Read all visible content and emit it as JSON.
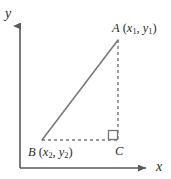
{
  "figure": {
    "background_color": "#ffffff",
    "line_color": "#6e6e6e",
    "axis_color": "#5a5a5a",
    "text_color": "#2b2b2b",
    "width": 171,
    "height": 179
  },
  "axes": {
    "x_label": "x",
    "y_label": "y",
    "x_axis": {
      "x1": 20,
      "y1": 168,
      "x2": 150,
      "y2": 168,
      "arrow": "right"
    },
    "y_axis": {
      "x1": 20,
      "y1": 168,
      "x2": 20,
      "y2": 22,
      "arrow": "up"
    }
  },
  "points": [
    {
      "name": "A",
      "label": "A",
      "coord_open": "(",
      "coord_x_var": "x",
      "coord_x_sub": "1",
      "coord_sep": ", ",
      "coord_y_var": "y",
      "coord_y_sub": "1",
      "coord_close": ")",
      "px": 118,
      "py": 40
    },
    {
      "name": "B",
      "label": "B",
      "coord_open": "(",
      "coord_x_var": "x",
      "coord_x_sub": "2",
      "coord_sep": ", ",
      "coord_y_var": "y",
      "coord_y_sub": "2",
      "coord_close": ")",
      "px": 42,
      "py": 140
    },
    {
      "name": "C",
      "label": "C",
      "px": 118,
      "py": 140
    }
  ],
  "segments": [
    {
      "name": "hypotenuse-ba",
      "from": "B",
      "to": "A",
      "style": "solid"
    },
    {
      "name": "leg-ac-vertical",
      "from": "A",
      "to": "C",
      "style": "dashed"
    },
    {
      "name": "leg-bc-horizontal",
      "from": "B",
      "to": "C",
      "style": "dashed"
    }
  ],
  "right_angle_marker": {
    "at_point": "C",
    "size": 9
  }
}
